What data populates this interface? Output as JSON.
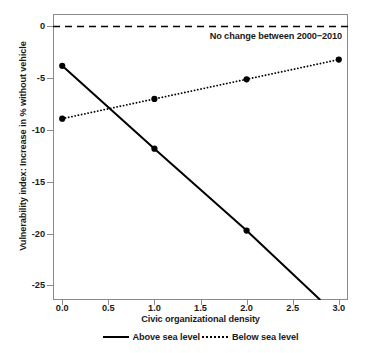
{
  "chart_data": {
    "type": "line",
    "title": "",
    "xlabel": "Civic organizational density",
    "ylabel": "Vulnerability index: Increase in % without vehicle",
    "xlim": [
      -0.1,
      3.1
    ],
    "ylim": [
      -26.4,
      1.2
    ],
    "xticks": [
      "0.0",
      "0.5",
      "1.0",
      "1.5",
      "2.0",
      "2.5",
      "3.0"
    ],
    "xtick_values": [
      0.0,
      0.5,
      1.0,
      1.5,
      2.0,
      2.5,
      3.0
    ],
    "yticks": [
      "0",
      "-5",
      "-10",
      "-15",
      "-20",
      "-25"
    ],
    "ytick_values": [
      0,
      -5,
      -10,
      -15,
      -20,
      -25
    ],
    "grid": false,
    "legend_position": "below",
    "series": [
      {
        "name": "Above sea level",
        "style": "solid",
        "color": "#000000",
        "x": [
          0.0,
          1.0,
          2.0
        ],
        "values": [
          -3.8,
          -11.8,
          -19.7
        ],
        "line_extends_to_x": 2.8,
        "line_extends_to_y": -26.4
      },
      {
        "name": "Below sea level",
        "style": "dotted",
        "color": "#000000",
        "x": [
          0.0,
          1.0,
          2.0,
          3.0
        ],
        "values": [
          -8.9,
          -7.0,
          -5.1,
          -3.2
        ]
      }
    ],
    "reference_line": {
      "value": 0,
      "style": "dashed",
      "color": "#000000",
      "label": "No change between 2000−2010"
    },
    "legend": [
      {
        "label": "Above sea level",
        "style": "solid"
      },
      {
        "label": "Below sea level",
        "style": "dotted"
      }
    ]
  }
}
